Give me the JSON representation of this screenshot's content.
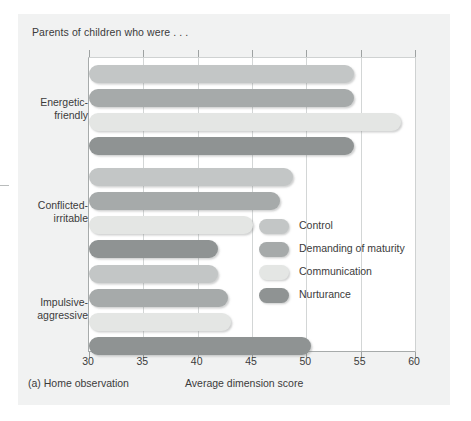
{
  "figure": {
    "title": "Parents of children who were . . .",
    "caption": "(a) Home observation"
  },
  "colors": {
    "control": "#c3c6c6",
    "demanding_of_maturity": "#a6aaaa",
    "communication": "#e4e6e4",
    "nurturance": "#8f9393",
    "panel_background": "#f1f2f2",
    "plot_background": "#ffffff",
    "gridline": "#d3d6d6",
    "axis": "#a7abab",
    "text": "#3b3b3b"
  },
  "legend": {
    "position": "inside-center-right",
    "entries": [
      {
        "label": "Control",
        "color_key": "control"
      },
      {
        "label": "Demanding of maturity",
        "color_key": "demanding_of_maturity"
      },
      {
        "label": "Communication",
        "color_key": "communication"
      },
      {
        "label": "Nurturance",
        "color_key": "nurturance"
      }
    ]
  },
  "chart_data": {
    "type": "bar",
    "orientation": "horizontal",
    "title": "Parents of children who were . . .",
    "subtitle": "(a) Home observation",
    "xlabel": "Average dimension score",
    "ylabel": "",
    "xlim": [
      30,
      60
    ],
    "xticks": [
      30,
      35,
      40,
      45,
      50,
      55,
      60
    ],
    "xtick_labels": [
      "30",
      "35",
      "40",
      "45",
      "50",
      "55",
      "60"
    ],
    "grid": "vertical",
    "categories": [
      "Energetic-friendly",
      "Conflicted-irritable",
      "Impulsive-aggressive"
    ],
    "series": [
      {
        "name": "Control",
        "values": [
          54.4,
          48.8,
          41.9
        ]
      },
      {
        "name": "Demanding of maturity",
        "values": [
          54.4,
          47.6,
          42.8
        ]
      },
      {
        "name": "Communication",
        "values": [
          58.7,
          45.1,
          43.1
        ]
      },
      {
        "name": "Nurturance",
        "values": [
          54.4,
          41.9,
          50.4
        ]
      }
    ]
  }
}
